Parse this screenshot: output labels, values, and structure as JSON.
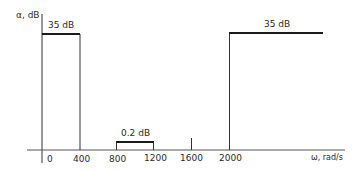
{
  "diagram": {
    "y_axis_label": "α, dB",
    "x_axis_label": "ω, rad/s",
    "x_ticks": [
      "0",
      "400",
      "800",
      "1200",
      "1600",
      "2000"
    ],
    "bands": [
      {
        "name": "stopband-low",
        "from": "0",
        "to": "400",
        "label": "35 dB"
      },
      {
        "name": "passband",
        "from": "800",
        "to": "1200",
        "label": "0.2 dB"
      },
      {
        "name": "stopband-high",
        "from": "2000",
        "to": "∞",
        "label": "35 dB"
      }
    ],
    "colors": {
      "line": "#1a1a1a",
      "text": "#2a2a2a"
    }
  }
}
